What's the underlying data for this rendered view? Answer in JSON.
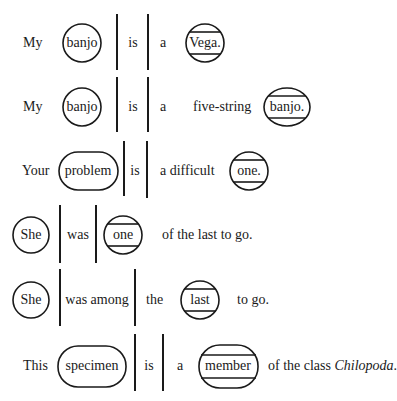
{
  "figure": {
    "rows": [
      {
        "sentence": "My banjo is a Vega.",
        "words": [
          "My",
          "banjo",
          "is",
          "a",
          "Vega."
        ],
        "subject": "banjo",
        "verb": "is",
        "complement": "Vega."
      },
      {
        "sentence": "My banjo is a five-string banjo.",
        "words": [
          "My",
          "banjo",
          "is",
          "a",
          "five-string",
          "banjo."
        ],
        "subject": "banjo",
        "verb": "is",
        "complement": "banjo."
      },
      {
        "sentence": "Your problem is a difficult one.",
        "words": [
          "Your",
          "problem",
          "is",
          "a difficult",
          "one."
        ],
        "subject": "problem",
        "verb": "is",
        "complement": "one."
      },
      {
        "sentence": "She was one of the last to go.",
        "words": [
          "She",
          "was",
          "one",
          "of the last to go."
        ],
        "subject": "She",
        "verb": "was",
        "complement": "one"
      },
      {
        "sentence": "She was among the last to go.",
        "words": [
          "She",
          "was among",
          "the",
          "last",
          "to go."
        ],
        "subject": "She",
        "verb": "was among",
        "complement": "last"
      },
      {
        "sentence": "This specimen is a member of the class Chilopoda.",
        "words": [
          "This",
          "specimen",
          "is",
          "a",
          "member",
          "of the class ",
          "Chilopoda",
          "."
        ],
        "subject": "specimen",
        "verb": "is",
        "complement": "member"
      }
    ],
    "legend": {
      "subject_shape": "circle/oval",
      "verb_marker": "vertical-bars",
      "complement_shape": "circle/oval with two horizontal lines"
    },
    "colors": {
      "ink": "#1a1a1a",
      "background": "#ffffff"
    }
  }
}
